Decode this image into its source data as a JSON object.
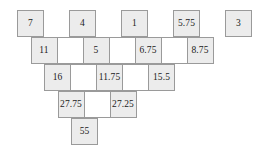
{
  "figure": {
    "type": "number-pyramid-grid",
    "rows": [
      {
        "index": 1,
        "cells": [
          {
            "value": "7",
            "shaded": true,
            "blank": false
          },
          {
            "value": "",
            "shaded": false,
            "blank": true
          },
          {
            "value": "4",
            "shaded": true,
            "blank": false
          },
          {
            "value": "",
            "shaded": false,
            "blank": true
          },
          {
            "value": "1",
            "shaded": true,
            "blank": false
          },
          {
            "value": "",
            "shaded": false,
            "blank": true
          },
          {
            "value": "5.75",
            "shaded": true,
            "blank": false
          },
          {
            "value": "",
            "shaded": false,
            "blank": true
          },
          {
            "value": "3",
            "shaded": true,
            "blank": false
          }
        ]
      },
      {
        "index": 2,
        "cells": [
          {
            "value": "11",
            "shaded": true,
            "blank": false
          },
          {
            "value": "",
            "shaded": false,
            "blank": false
          },
          {
            "value": "5",
            "shaded": true,
            "blank": false
          },
          {
            "value": "",
            "shaded": false,
            "blank": false
          },
          {
            "value": "6.75",
            "shaded": true,
            "blank": false
          },
          {
            "value": "",
            "shaded": false,
            "blank": false
          },
          {
            "value": "8.75",
            "shaded": true,
            "blank": false
          }
        ]
      },
      {
        "index": 3,
        "cells": [
          {
            "value": "16",
            "shaded": true,
            "blank": false
          },
          {
            "value": "",
            "shaded": false,
            "blank": false
          },
          {
            "value": "11.75",
            "shaded": true,
            "blank": false
          },
          {
            "value": "",
            "shaded": false,
            "blank": false
          },
          {
            "value": "15.5",
            "shaded": true,
            "blank": false
          }
        ]
      },
      {
        "index": 4,
        "cells": [
          {
            "value": "27.75",
            "shaded": true,
            "blank": false
          },
          {
            "value": "",
            "shaded": false,
            "blank": false
          },
          {
            "value": "27.25",
            "shaded": true,
            "blank": false
          }
        ]
      },
      {
        "index": 5,
        "cells": [
          {
            "value": "55",
            "shaded": true,
            "blank": false
          }
        ]
      }
    ]
  },
  "chart_data": {
    "type": "table",
    "title": "",
    "xlabel": "",
    "ylabel": "",
    "levels": [
      {
        "level": 1,
        "values": [
          7,
          4,
          1,
          5.75,
          3
        ]
      },
      {
        "level": 2,
        "values": [
          11,
          5,
          6.75,
          8.75
        ]
      },
      {
        "level": 3,
        "values": [
          16,
          11.75,
          15.5
        ]
      },
      {
        "level": 4,
        "values": [
          27.75,
          27.25
        ]
      },
      {
        "level": 5,
        "values": [
          55
        ]
      }
    ],
    "labels_top": [
      "7",
      "4",
      "1",
      "5.75",
      "3"
    ],
    "labels_row2": [
      "11",
      "5",
      "6.75",
      "8.75"
    ],
    "labels_row3": [
      "16",
      "11.75",
      "15.5"
    ],
    "labels_row4": [
      "27.75",
      "27.25"
    ],
    "labels_row5": [
      "55"
    ],
    "colors": {
      "cell_shaded": "#ececec",
      "cell_plain": "#ffffff",
      "border": "#9a9a9a",
      "text": "#1a1a1a",
      "background": "#ffffff"
    }
  }
}
